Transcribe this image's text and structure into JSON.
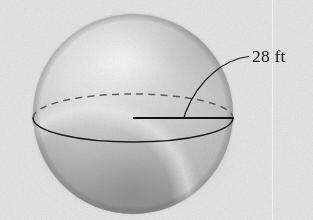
{
  "figure": {
    "kind": "solid-geometry-figure",
    "solid": "sphere",
    "caption_text": "28 ft",
    "measurement": {
      "value": "28",
      "unit": "ft",
      "label": "28 ft",
      "measures": "radius"
    },
    "background_color": "#e4e4e4",
    "ink_color": "#1d1d1d",
    "shading": {
      "highlight_color": "#f4f4f4",
      "midtone_color": "#c6c6c6",
      "shadow_color": "#8f8f8f",
      "rim_light_color": "#e8e8e8",
      "highlight_center": "125, 62"
    },
    "geometry": {
      "sphere": {
        "cx": 133,
        "cy": 114,
        "r": 100
      },
      "equator_ellipse": {
        "cx": 133,
        "cy": 118,
        "rx": 100,
        "ry": 24
      },
      "radius_line": {
        "x1": 133,
        "y1": 118,
        "x2": 233,
        "y2": 118
      },
      "leader_curve": {
        "x1": 247,
        "y1": 57,
        "x2": 184,
        "y2": 118
      }
    },
    "elements": {
      "sphere_body_name": "sphere-body",
      "equator_front_name": "equator-front-arc",
      "equator_back_name": "equator-back-arc-dashed",
      "radius_line_name": "radius-line",
      "leader_line_name": "leader-line",
      "label_name": "dimension-label"
    }
  }
}
